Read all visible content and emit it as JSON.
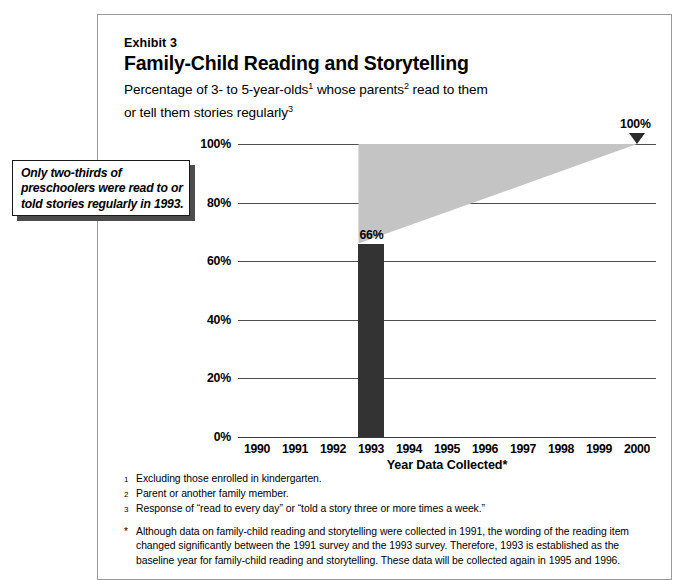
{
  "figure": {
    "exhibit_label": "Exhibit 3",
    "title": "Family-Child Reading and Storytelling",
    "subtitle_line1_a": "Percentage of 3- to 5-year-olds",
    "subtitle_sup1": "1",
    "subtitle_line1_b": " whose parents",
    "subtitle_sup2": "2",
    "subtitle_line1_c": " read to them",
    "subtitle_line2_a": "or tell them stories regularly",
    "subtitle_sup3": "3"
  },
  "callout": {
    "text": "Only two-thirds of preschoolers were read to or told stories regularly in 1993."
  },
  "chart_data": {
    "type": "bar",
    "title": "Family-Child Reading and Storytelling",
    "subtitle": "Percentage of 3- to 5-year-olds whose parents read to them or tell them stories regularly",
    "xlabel": "Year Data Collected*",
    "ylabel": "",
    "categories": [
      "1990",
      "1991",
      "1992",
      "1993",
      "1994",
      "1995",
      "1996",
      "1997",
      "1998",
      "1999",
      "2000"
    ],
    "values": [
      null,
      null,
      null,
      66,
      null,
      null,
      null,
      null,
      null,
      null,
      null
    ],
    "bar_labels": {
      "1993": "66%"
    },
    "ylim": [
      0,
      100
    ],
    "yticks": [
      0,
      20,
      40,
      60,
      80,
      100
    ],
    "ytick_labels": [
      "0%",
      "20%",
      "40%",
      "60%",
      "80%",
      "100%"
    ],
    "grid": true,
    "legend": false,
    "annotations": [
      {
        "name": "target-marker",
        "label": "100%",
        "x": "2000",
        "y": 100,
        "marker": "down-triangle"
      }
    ],
    "projection": {
      "name": "goal-wedge",
      "description": "Shaded wedge from 1993 baseline of 66% widening to 100% target at 2000",
      "start_year": "1993",
      "start_value": 66,
      "end_year": "2000",
      "end_value": 100,
      "top_cap_value": 100,
      "color": "#c4c4c4"
    },
    "colors": {
      "bar": "#333333",
      "wedge": "#c4c4c4",
      "gridline": "#4d4d4d"
    }
  },
  "footnotes": [
    {
      "marker": "1",
      "text": "Excluding those enrolled in kindergarten."
    },
    {
      "marker": "2",
      "text": "Parent or another family member."
    },
    {
      "marker": "3",
      "text": "Response of “read to every day” or “told a story three or more times a week.”"
    }
  ],
  "asterisk_note": {
    "marker": "*",
    "text": "Although data on family-child reading and storytelling were collected in 1991, the wording of the reading item changed significantly between the 1991 survey and the 1993 survey.  Therefore, 1993 is established as the baseline year for family-child reading and storytelling.  These data will be collected again in 1995 and 1996."
  }
}
